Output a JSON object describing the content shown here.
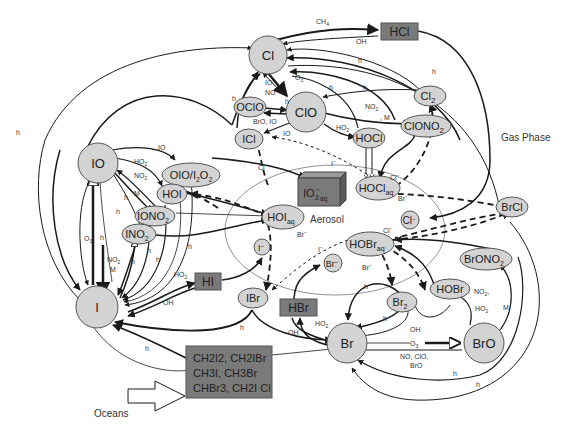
{
  "regions": {
    "gas_phase": "Gas Phase",
    "aerosol": "Aerosol",
    "oceans": "Oceans"
  },
  "nodes": {
    "Cl": "Cl",
    "HCl": "HCl",
    "ClO": "ClO",
    "OClO": "OClO",
    "ICl": "ICl",
    "Cl2": "Cl",
    "Cl2_sub": "2",
    "ClONO2": "ClONO",
    "ClONO2_sub": "2",
    "HOCl": "HOCl",
    "HOClaq": "HOCl",
    "HOClaq_sub": "aq",
    "IO": "IO",
    "OIO_I2O2": "OIO/I",
    "OIO_I2O2_mid": "2",
    "OIO_I2O2_end": "O",
    "OIO_I2O2_sub": "2",
    "HOI": "HOI",
    "IONO2": "IONO",
    "IONO2_sub": "2",
    "INO2": "INO",
    "INO2_sub": "2",
    "I": "I",
    "IO3aq": "IO",
    "IO3aq_sub": "3",
    "IO3aq_sup": "−",
    "IO3aq_aq": "aq",
    "HOIaq": "HOI",
    "HOIaq_sub": "aq",
    "Iminus": "I",
    "Iminus_sup": "−",
    "Clminus": "Cl",
    "Clminus_sup": "−",
    "BrCl": "BrCl",
    "HOBraq": "HOBr",
    "HOBraq_sub": "aq",
    "Brminus": "Br",
    "Brminus_sup": "−",
    "HI": "HI",
    "IBr": "IBr",
    "HBr": "HBr",
    "Br2": "Br",
    "Br2_sub": "2",
    "HOBr": "HOBr",
    "BrONO2": "BrONO",
    "BrONO2_sub": "2",
    "Br": "Br",
    "BrO": "BrO"
  },
  "sources_box": {
    "line1": "CH2I2, CH2IBr",
    "line2": "CH3I, CH3Br",
    "line3": "CHBr3, CH2I Cl"
  },
  "labels": {
    "CH4": "CH",
    "CH4_sub": "4",
    "OH": "OH",
    "h": "h",
    "O3": "O",
    "O3_sub": "3",
    "IO_NO": "IO,",
    "NO": "NO",
    "BrO_IO": "BrO, IO",
    "IO": "IO",
    "NO2": "NO",
    "NO2_sub": "2",
    "M": "M",
    "comma_M": ", M",
    "HO2": "HO",
    "HO2_sub": "2",
    "Clm": "Cl",
    "Brm": "Br",
    "Im": "I",
    "minus": "−",
    "NO_ClO": "NO, ClO,",
    "BrO": "BrO",
    "NO2_comma": "NO",
    "NO2_comma_sub": "2",
    "NO2_comma_end": ","
  },
  "colors": {
    "node_fill": "#d3d3d3",
    "box_fill": "#7a7a7a",
    "line": "#1a1a1a",
    "thin_line": "#555555"
  }
}
